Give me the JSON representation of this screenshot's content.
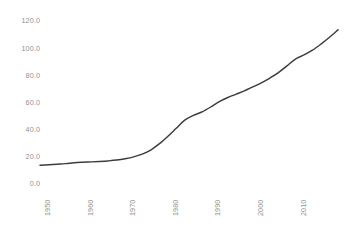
{
  "chart_data": {
    "type": "line",
    "title": "",
    "xlabel": "",
    "ylabel": "",
    "grid": false,
    "legend": false,
    "legend_position": "none",
    "line_color": "#3c3c3c",
    "background_color": "#ffffff",
    "tick_color": "#919191",
    "xlim": [
      1950,
      2020
    ],
    "ylim": [
      0.0,
      120.0
    ],
    "y_ticks": [
      "0.0",
      "20.0",
      "40.0",
      "60.0",
      "80.0",
      "100.0",
      "120.0"
    ],
    "y_tick_values": [
      0,
      20,
      40,
      60,
      80,
      100,
      120
    ],
    "x_ticks": [
      "1950",
      "1960",
      "1970",
      "1980",
      "1990",
      "2000",
      "2010"
    ],
    "x_tick_values": [
      1950,
      1960,
      1970,
      1980,
      1990,
      2000,
      2010
    ],
    "x_tick_rotation": -90,
    "series": [
      {
        "name": "series-1",
        "x": [
          1950,
          1952,
          1954,
          1956,
          1958,
          1960,
          1962,
          1964,
          1966,
          1968,
          1970,
          1972,
          1974,
          1976,
          1978,
          1980,
          1982,
          1984,
          1986,
          1988,
          1990,
          1992,
          1994,
          1996,
          1998,
          2000,
          2002,
          2004,
          2006,
          2008,
          2010,
          2012,
          2014,
          2016,
          2018,
          2020
        ],
        "values": [
          13.8,
          14.2,
          14.6,
          15.0,
          15.6,
          16.0,
          16.3,
          16.6,
          17.0,
          17.6,
          18.6,
          20.0,
          22.0,
          25.0,
          29.5,
          35.0,
          41.0,
          47.0,
          50.5,
          53.0,
          56.5,
          60.5,
          63.5,
          66.0,
          68.5,
          71.5,
          74.5,
          78.0,
          82.0,
          87.0,
          92.0,
          95.0,
          98.5,
          103.0,
          108.0,
          113.5
        ]
      }
    ]
  }
}
